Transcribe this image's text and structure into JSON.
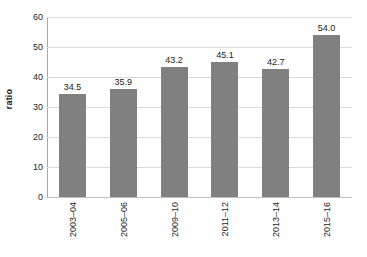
{
  "chart_data": {
    "type": "bar",
    "title": "",
    "subtitle": "",
    "xlabel": "",
    "ylabel": "ratio",
    "categories": [
      "2003–04",
      "2005–06",
      "2009–10",
      "2011–12",
      "2013–14",
      "2015–16"
    ],
    "values": [
      34.5,
      35.9,
      43.2,
      45.1,
      42.7,
      54.0
    ],
    "data_labels": [
      "34.5",
      "35.9",
      "43.2",
      "45.1",
      "42.7",
      "54.0"
    ],
    "ylim": [
      0,
      60
    ],
    "ytick_values": [
      0,
      10,
      20,
      30,
      40,
      50,
      60
    ],
    "ytick_labels": [
      "0",
      "10",
      "20",
      "30",
      "40",
      "50",
      "60"
    ],
    "xtick_labels": [
      "2003–04",
      "2005–06",
      "2009–10",
      "2011–12",
      "2013–14",
      "2015–16"
    ],
    "grid": true,
    "grid_axis": "y",
    "legend": false,
    "legend_position": "none",
    "series": [
      {
        "name": "ratio",
        "color": "#808080",
        "values": [
          34.5,
          35.9,
          43.2,
          45.1,
          42.7,
          54.0
        ]
      }
    ],
    "annotations": []
  },
  "style": {
    "bar_color": "#808080",
    "grid_color": "#d9d9d9",
    "axis_color": "#a6a6a6",
    "text_color": "#262626",
    "background": "#ffffff"
  }
}
